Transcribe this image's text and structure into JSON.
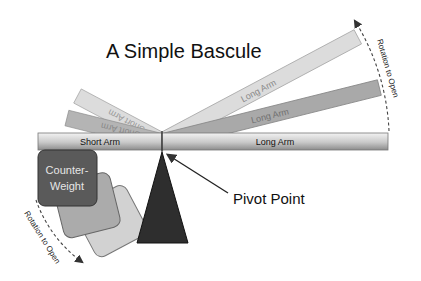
{
  "title": "A Simple Bascule",
  "labels": {
    "short_arm": "Short Arm",
    "long_arm": "Long Arm",
    "long_arm_mid": "Long Arm",
    "long_arm_high": "Long Arm",
    "short_arm_ghost1": "Short Arm",
    "short_arm_ghost2": "Short Arm",
    "counterweight_line1": "Counter-",
    "counterweight_line2": "Weight",
    "pivot_point": "Pivot Point",
    "rotation_right": "Rotation to Open",
    "rotation_left": "Rotation to Open"
  },
  "colors": {
    "bar_light": "#e8e8e8",
    "bar_dark": "#9a9a9a",
    "arm_mid": "#a9a9a9",
    "arm_high": "#dcdcdc",
    "counterweight_dark": "#5a5a5a",
    "counterweight_mid": "#a8a8a8",
    "counterweight_light": "#cfcfcf",
    "pivot": "#2e2e2e",
    "text": "#111111"
  }
}
